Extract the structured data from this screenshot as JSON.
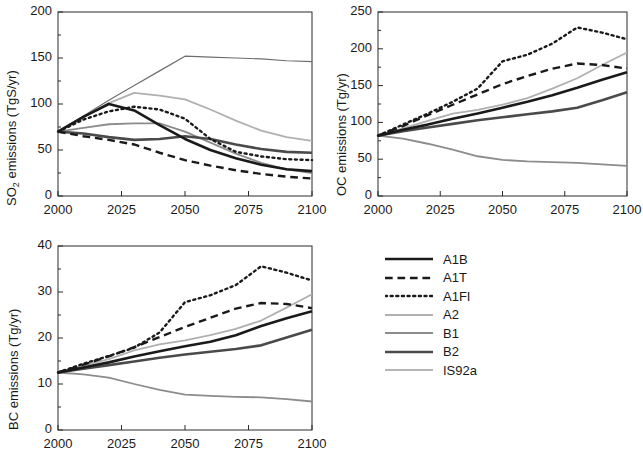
{
  "figure": {
    "panels": [
      "so2",
      "oc",
      "bc"
    ],
    "x_axis": {
      "label": "",
      "ticks": [
        2000,
        2025,
        2050,
        2075,
        2100
      ],
      "tick_labels": [
        "2000",
        "2025",
        "2050",
        "2075",
        "2100"
      ],
      "min": 2000,
      "max": 2100
    }
  },
  "legend": {
    "position": "bottom-right",
    "entries": [
      {
        "label": "A1B",
        "style": "solid",
        "color": "#1a1a1a",
        "width": 2.6
      },
      {
        "label": "A1T",
        "style": "dashed",
        "color": "#1a1a1a",
        "width": 2.4
      },
      {
        "label": "A1FI",
        "style": "dotted",
        "color": "#1a1a1a",
        "width": 2.4
      },
      {
        "label": "A2",
        "style": "solid",
        "color": "#b0b0b0",
        "width": 1.8
      },
      {
        "label": "B1",
        "style": "solid",
        "color": "#8c8c8c",
        "width": 1.8
      },
      {
        "label": "B2",
        "style": "solid",
        "color": "#4a4a4a",
        "width": 2.6
      },
      {
        "label": "IS92a",
        "style": "solid",
        "color": "#6e6e6e",
        "width": 1.2
      }
    ]
  },
  "chart_data": [
    {
      "type": "line",
      "id": "so2",
      "title": "",
      "xlabel": "",
      "ylabel": "SO2 emissions  (TgS/yr)",
      "ylabel_parts": {
        "pre": "SO",
        "sub": "2",
        "post": " emissions  (TgS/yr)"
      },
      "xlim": [
        2000,
        2100
      ],
      "ylim": [
        0,
        200
      ],
      "yticks": [
        0,
        50,
        100,
        150,
        200
      ],
      "ytick_labels": [
        "0",
        "50",
        "100",
        "150",
        "200"
      ],
      "xticks": [
        2000,
        2025,
        2050,
        2075,
        2100
      ],
      "xtick_labels": [
        "2000",
        "2025",
        "2050",
        "2075",
        "2100"
      ],
      "grid": false,
      "x": [
        2000,
        2010,
        2020,
        2030,
        2040,
        2050,
        2060,
        2070,
        2080,
        2090,
        2100
      ],
      "series": [
        {
          "name": "A1B",
          "values": [
            70,
            86,
            100,
            93,
            77,
            62,
            50,
            41,
            34,
            29,
            27
          ]
        },
        {
          "name": "A1T",
          "values": [
            70,
            65,
            61,
            56,
            47,
            39,
            33,
            28,
            24,
            21,
            19
          ]
        },
        {
          "name": "A1FI",
          "values": [
            70,
            83,
            92,
            97,
            94,
            84,
            62,
            48,
            43,
            40,
            39
          ]
        },
        {
          "name": "A2",
          "values": [
            70,
            86,
            101,
            112,
            109,
            105,
            94,
            82,
            71,
            64,
            60
          ]
        },
        {
          "name": "B1",
          "values": [
            70,
            74,
            78,
            79,
            79,
            70,
            58,
            46,
            36,
            29,
            25
          ]
        },
        {
          "name": "B2",
          "values": [
            70,
            68,
            64,
            61,
            62,
            65,
            62,
            56,
            51,
            48,
            47
          ]
        },
        {
          "name": "IS92a",
          "values": [
            70,
            87,
            104,
            120,
            136,
            152,
            151,
            150,
            149,
            147,
            146
          ]
        }
      ]
    },
    {
      "type": "line",
      "id": "oc",
      "title": "",
      "xlabel": "",
      "ylabel": "OC emissions  (Tg/yr)",
      "xlim": [
        2000,
        2100
      ],
      "ylim": [
        0,
        250
      ],
      "yticks": [
        0,
        50,
        100,
        150,
        200,
        250
      ],
      "ytick_labels": [
        "0",
        "50",
        "100",
        "150",
        "200",
        "250"
      ],
      "xticks": [
        2000,
        2025,
        2050,
        2075,
        2100
      ],
      "xtick_labels": [
        "2000",
        "2025",
        "2050",
        "2075",
        "2100"
      ],
      "grid": false,
      "x": [
        2000,
        2010,
        2020,
        2030,
        2040,
        2050,
        2060,
        2070,
        2080,
        2090,
        2100
      ],
      "series": [
        {
          "name": "A1B",
          "values": [
            82,
            90,
            97,
            105,
            112,
            120,
            128,
            137,
            147,
            158,
            168
          ]
        },
        {
          "name": "A1T",
          "values": [
            82,
            95,
            110,
            124,
            138,
            152,
            163,
            173,
            180,
            178,
            173
          ]
        },
        {
          "name": "A1FI",
          "values": [
            82,
            97,
            112,
            128,
            146,
            183,
            192,
            207,
            229,
            222,
            213
          ]
        },
        {
          "name": "A2",
          "values": [
            82,
            92,
            102,
            112,
            117,
            124,
            133,
            146,
            160,
            178,
            195
          ]
        },
        {
          "name": "B1",
          "values": [
            82,
            78,
            71,
            63,
            54,
            49,
            47,
            46,
            45,
            43,
            41
          ]
        },
        {
          "name": "B2",
          "values": [
            82,
            88,
            93,
            98,
            103,
            107,
            111,
            115,
            120,
            130,
            141
          ]
        }
      ]
    },
    {
      "type": "line",
      "id": "bc",
      "title": "",
      "xlabel": "",
      "ylabel": "BC emissions  (Tg/yr)",
      "xlim": [
        2000,
        2100
      ],
      "ylim": [
        0,
        40
      ],
      "yticks": [
        0,
        10,
        20,
        30,
        40
      ],
      "ytick_labels": [
        "0",
        "10",
        "20",
        "30",
        "40"
      ],
      "xticks": [
        2000,
        2025,
        2050,
        2075,
        2100
      ],
      "xtick_labels": [
        "2000",
        "2025",
        "2050",
        "2075",
        "2100"
      ],
      "grid": false,
      "x": [
        2000,
        2010,
        2020,
        2030,
        2040,
        2050,
        2060,
        2070,
        2080,
        2090,
        2100
      ],
      "series": [
        {
          "name": "A1B",
          "values": [
            12.5,
            13.6,
            14.7,
            16.0,
            17.1,
            18.2,
            19.2,
            20.6,
            22.6,
            24.3,
            25.8
          ]
        },
        {
          "name": "A1T",
          "values": [
            12.5,
            14.2,
            16.0,
            18.0,
            20.2,
            22.4,
            24.4,
            26.4,
            27.6,
            27.4,
            26.5
          ]
        },
        {
          "name": "A1FI",
          "values": [
            12.5,
            14.4,
            16.1,
            17.9,
            21.2,
            27.8,
            29.3,
            31.5,
            35.6,
            34.2,
            32.5
          ]
        },
        {
          "name": "A2",
          "values": [
            12.5,
            14.0,
            15.4,
            17.3,
            18.6,
            19.5,
            20.6,
            22.0,
            23.8,
            26.6,
            29.5
          ]
        },
        {
          "name": "B1",
          "values": [
            12.5,
            12.1,
            11.4,
            10.0,
            8.7,
            7.7,
            7.4,
            7.2,
            7.1,
            6.7,
            6.2
          ]
        },
        {
          "name": "B2",
          "values": [
            12.5,
            13.3,
            14.1,
            14.9,
            15.7,
            16.4,
            17.0,
            17.6,
            18.4,
            20.1,
            21.8
          ]
        }
      ]
    }
  ]
}
